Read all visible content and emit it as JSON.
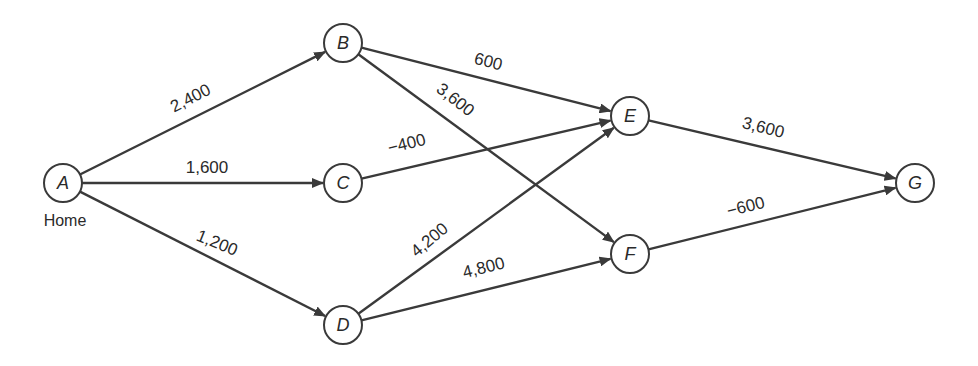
{
  "diagram": {
    "type": "directed-network",
    "node_radius": 19,
    "colors": {
      "stroke": "#3a3a3a",
      "text": "#2a2a2a",
      "background": "#ffffff"
    },
    "nodes": [
      {
        "id": "A",
        "label": "A",
        "x": 63,
        "y": 183,
        "caption": "Home"
      },
      {
        "id": "B",
        "label": "B",
        "x": 343,
        "y": 43
      },
      {
        "id": "C",
        "label": "C",
        "x": 343,
        "y": 183
      },
      {
        "id": "D",
        "label": "D",
        "x": 343,
        "y": 325
      },
      {
        "id": "E",
        "label": "E",
        "x": 630,
        "y": 116
      },
      {
        "id": "F",
        "label": "F",
        "x": 630,
        "y": 254
      },
      {
        "id": "G",
        "label": "G",
        "x": 915,
        "y": 183
      }
    ],
    "edges": [
      {
        "from": "A",
        "to": "B",
        "label": "2,400",
        "lx": 193,
        "ly": 103,
        "rot": -27
      },
      {
        "from": "A",
        "to": "C",
        "label": "1,600",
        "lx": 207,
        "ly": 173,
        "rot": 0
      },
      {
        "from": "A",
        "to": "D",
        "label": "1,200",
        "lx": 215,
        "ly": 248,
        "rot": 22
      },
      {
        "from": "B",
        "to": "E",
        "label": "600",
        "lx": 487,
        "ly": 67,
        "rot": 14
      },
      {
        "from": "B",
        "to": "F",
        "label": "3,600",
        "lx": 452,
        "ly": 104,
        "rot": 38
      },
      {
        "from": "C",
        "to": "E",
        "label": "−400",
        "lx": 408,
        "ly": 149,
        "rot": -14
      },
      {
        "from": "D",
        "to": "E",
        "label": "4,200",
        "lx": 433,
        "ly": 244,
        "rot": -40
      },
      {
        "from": "D",
        "to": "F",
        "label": "4,800",
        "lx": 485,
        "ly": 273,
        "rot": -14
      },
      {
        "from": "E",
        "to": "G",
        "label": "3,600",
        "lx": 762,
        "ly": 133,
        "rot": 14
      },
      {
        "from": "F",
        "to": "G",
        "label": "−600",
        "lx": 747,
        "ly": 212,
        "rot": -14
      }
    ]
  }
}
